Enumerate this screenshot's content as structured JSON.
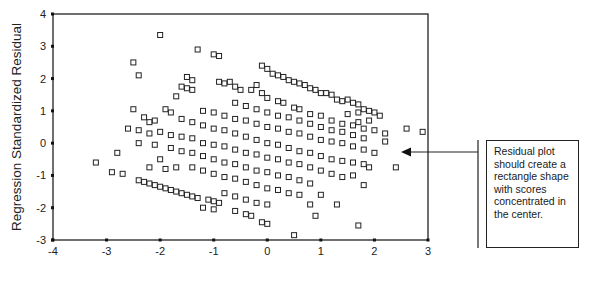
{
  "chart_data": {
    "type": "scatter",
    "title": "",
    "xlabel": "",
    "ylabel": "Regression Standardized Residual",
    "xlim": [
      -4,
      3
    ],
    "ylim": [
      -3,
      4
    ],
    "xticks": [
      "-4",
      "-3",
      "-2",
      "-1",
      "0",
      "1",
      "2",
      "3"
    ],
    "yticks": [
      "4",
      "3",
      "2",
      "1",
      "0",
      "-1",
      "-2",
      "-3"
    ],
    "grid": false,
    "legend": null,
    "marker": "open-square",
    "marker_color": "#222222",
    "pattern": "diagonal bands with slope about -0.45, densest near center",
    "annotation": {
      "text": "Residual plot should create a rectangle shape with scores concentrated in the center.",
      "arrow_target": [
        2.4,
        -0.3
      ]
    },
    "points": [
      [
        -2.0,
        3.35
      ],
      [
        -1.3,
        2.9
      ],
      [
        -1.0,
        2.75
      ],
      [
        -0.9,
        2.7
      ],
      [
        -2.5,
        2.5
      ],
      [
        -2.4,
        2.1
      ],
      [
        -1.5,
        2.05
      ],
      [
        -1.4,
        1.95
      ],
      [
        -1.6,
        1.75
      ],
      [
        -1.5,
        1.7
      ],
      [
        -1.4,
        1.65
      ],
      [
        -1.7,
        1.45
      ],
      [
        -0.9,
        1.9
      ],
      [
        -0.8,
        1.85
      ],
      [
        -0.7,
        1.9
      ],
      [
        -0.6,
        1.75
      ],
      [
        -0.5,
        1.65
      ],
      [
        -0.1,
        2.4
      ],
      [
        0.0,
        2.3
      ],
      [
        0.1,
        2.15
      ],
      [
        0.2,
        2.1
      ],
      [
        0.3,
        2.05
      ],
      [
        0.4,
        1.95
      ],
      [
        0.5,
        1.9
      ],
      [
        0.6,
        1.85
      ],
      [
        0.7,
        1.8
      ],
      [
        0.8,
        1.7
      ],
      [
        0.9,
        1.65
      ],
      [
        1.0,
        1.55
      ],
      [
        1.1,
        1.55
      ],
      [
        1.2,
        1.5
      ],
      [
        1.3,
        1.35
      ],
      [
        1.4,
        1.3
      ],
      [
        1.5,
        1.35
      ],
      [
        1.6,
        1.25
      ],
      [
        1.7,
        1.2
      ],
      [
        1.8,
        1.05
      ],
      [
        1.9,
        1.0
      ],
      [
        2.0,
        0.95
      ],
      [
        -2.5,
        1.05
      ],
      [
        -2.3,
        0.8
      ],
      [
        -2.1,
        0.7
      ],
      [
        -2.2,
        0.65
      ],
      [
        -1.9,
        1.05
      ],
      [
        -1.8,
        0.95
      ],
      [
        -0.2,
        1.8
      ],
      [
        -0.3,
        1.65
      ],
      [
        -0.1,
        1.55
      ],
      [
        0.0,
        1.4
      ],
      [
        0.2,
        1.3
      ],
      [
        0.3,
        1.25
      ],
      [
        0.5,
        1.1
      ],
      [
        0.6,
        1.05
      ],
      [
        0.8,
        0.9
      ],
      [
        1.0,
        0.85
      ],
      [
        1.2,
        0.7
      ],
      [
        1.4,
        0.6
      ],
      [
        1.6,
        0.55
      ],
      [
        1.8,
        0.45
      ],
      [
        2.0,
        0.4
      ],
      [
        2.2,
        0.3
      ],
      [
        2.1,
        0.85
      ],
      [
        1.9,
        0.7
      ],
      [
        1.7,
        0.65
      ],
      [
        2.6,
        0.45
      ],
      [
        2.9,
        0.35
      ],
      [
        -2.6,
        0.45
      ],
      [
        -2.4,
        0.4
      ],
      [
        -2.2,
        0.3
      ],
      [
        -2.0,
        0.35
      ],
      [
        -1.8,
        0.25
      ],
      [
        -1.6,
        0.2
      ],
      [
        -1.4,
        0.15
      ],
      [
        -1.2,
        0.0
      ],
      [
        -1.0,
        -0.05
      ],
      [
        -0.8,
        -0.1
      ],
      [
        -0.6,
        -0.2
      ],
      [
        -0.4,
        -0.3
      ],
      [
        -0.2,
        -0.35
      ],
      [
        0.0,
        -0.45
      ],
      [
        0.2,
        -0.5
      ],
      [
        0.4,
        -0.6
      ],
      [
        0.6,
        -0.65
      ],
      [
        0.8,
        -0.75
      ],
      [
        1.0,
        -0.85
      ],
      [
        1.2,
        -0.95
      ],
      [
        1.4,
        -1.05
      ],
      [
        -1.6,
        0.75
      ],
      [
        -1.4,
        0.65
      ],
      [
        -1.2,
        0.55
      ],
      [
        -1.0,
        0.45
      ],
      [
        -0.8,
        0.4
      ],
      [
        -0.6,
        0.3
      ],
      [
        -0.4,
        0.2
      ],
      [
        -0.2,
        0.1
      ],
      [
        0.0,
        0.0
      ],
      [
        0.2,
        -0.05
      ],
      [
        0.4,
        -0.15
      ],
      [
        0.6,
        -0.25
      ],
      [
        0.8,
        -0.3
      ],
      [
        1.0,
        -0.4
      ],
      [
        1.2,
        -0.5
      ],
      [
        1.4,
        -0.55
      ],
      [
        1.6,
        -0.6
      ],
      [
        1.8,
        -0.65
      ],
      [
        -1.2,
        1.0
      ],
      [
        -1.0,
        0.95
      ],
      [
        -0.8,
        0.85
      ],
      [
        -0.6,
        0.75
      ],
      [
        -0.4,
        0.7
      ],
      [
        -0.2,
        0.6
      ],
      [
        0.0,
        0.5
      ],
      [
        0.2,
        0.45
      ],
      [
        0.4,
        0.35
      ],
      [
        0.6,
        0.3
      ],
      [
        0.8,
        0.2
      ],
      [
        1.0,
        0.1
      ],
      [
        1.2,
        0.05
      ],
      [
        1.4,
        0.0
      ],
      [
        1.6,
        -0.1
      ],
      [
        1.8,
        -0.2
      ],
      [
        2.0,
        -0.3
      ],
      [
        -0.6,
        1.25
      ],
      [
        -0.4,
        1.15
      ],
      [
        -0.2,
        1.05
      ],
      [
        0.0,
        0.95
      ],
      [
        0.2,
        0.85
      ],
      [
        0.4,
        0.8
      ],
      [
        0.6,
        0.7
      ],
      [
        0.8,
        0.6
      ],
      [
        1.0,
        0.5
      ],
      [
        1.2,
        0.4
      ],
      [
        1.4,
        0.35
      ],
      [
        1.6,
        0.25
      ],
      [
        1.8,
        0.15
      ],
      [
        -1.8,
        -0.15
      ],
      [
        -1.6,
        -0.25
      ],
      [
        -1.4,
        -0.3
      ],
      [
        -1.2,
        -0.4
      ],
      [
        -1.0,
        -0.5
      ],
      [
        -0.8,
        -0.6
      ],
      [
        -0.6,
        -0.65
      ],
      [
        -0.4,
        -0.75
      ],
      [
        -0.2,
        -0.85
      ],
      [
        0.0,
        -0.9
      ],
      [
        0.2,
        -1.0
      ],
      [
        0.4,
        -1.05
      ],
      [
        0.6,
        -1.15
      ],
      [
        0.8,
        -1.25
      ],
      [
        -1.4,
        -0.75
      ],
      [
        -1.2,
        -0.85
      ],
      [
        -1.0,
        -0.95
      ],
      [
        -0.8,
        -1.05
      ],
      [
        -0.6,
        -1.1
      ],
      [
        -0.4,
        -1.2
      ],
      [
        -0.2,
        -1.3
      ],
      [
        0.0,
        -1.4
      ],
      [
        0.2,
        -1.45
      ],
      [
        0.4,
        -1.55
      ],
      [
        0.6,
        -1.6
      ],
      [
        -2.4,
        -1.15
      ],
      [
        -2.3,
        -1.2
      ],
      [
        -2.2,
        -1.25
      ],
      [
        -2.1,
        -1.3
      ],
      [
        -2.0,
        -1.35
      ],
      [
        -1.9,
        -1.4
      ],
      [
        -1.8,
        -1.45
      ],
      [
        -1.7,
        -1.5
      ],
      [
        -1.6,
        -1.55
      ],
      [
        -1.5,
        -1.6
      ],
      [
        -1.4,
        -1.65
      ],
      [
        -1.3,
        -1.7
      ],
      [
        -1.1,
        -1.75
      ],
      [
        -1.0,
        -1.8
      ],
      [
        -0.9,
        -1.85
      ],
      [
        -0.8,
        -1.55
      ],
      [
        -0.6,
        -1.65
      ],
      [
        -0.4,
        -1.75
      ],
      [
        -0.2,
        -1.85
      ],
      [
        0.0,
        -1.9
      ],
      [
        -1.2,
        -2.0
      ],
      [
        -1.0,
        -2.05
      ],
      [
        -0.6,
        -2.1
      ],
      [
        -0.4,
        -2.2
      ],
      [
        -0.3,
        -2.25
      ],
      [
        -0.1,
        -2.45
      ],
      [
        0.0,
        -2.5
      ],
      [
        0.5,
        -2.85
      ],
      [
        1.7,
        -2.55
      ],
      [
        0.9,
        -2.25
      ],
      [
        -3.2,
        -0.6
      ],
      [
        -2.8,
        -0.3
      ],
      [
        -2.9,
        -0.9
      ],
      [
        -2.7,
        -0.95
      ],
      [
        -2.0,
        -0.5
      ],
      [
        -1.7,
        -0.75
      ],
      [
        -2.1,
        -0.05
      ],
      [
        -2.4,
        0.0
      ],
      [
        -2.2,
        -0.75
      ],
      [
        -1.9,
        -0.8
      ],
      [
        1.3,
        -1.9
      ],
      [
        1.8,
        -1.3
      ],
      [
        2.4,
        -0.75
      ],
      [
        1.9,
        -0.75
      ],
      [
        2.2,
        0.05
      ],
      [
        1.6,
        -1.0
      ],
      [
        1.0,
        -1.6
      ],
      [
        0.8,
        -1.9
      ],
      [
        1.5,
        0.9
      ],
      [
        1.7,
        0.95
      ]
    ]
  },
  "annotation_box": {
    "text": "Residual plot should create a rectangle shape with scores concentrated in the center."
  }
}
